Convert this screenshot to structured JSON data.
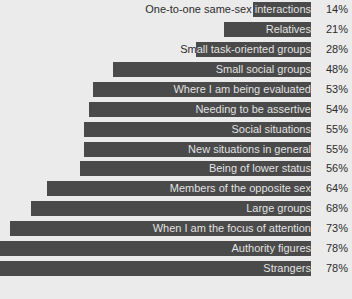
{
  "chart_data": {
    "type": "bar",
    "orientation": "horizontal",
    "title": "",
    "subtitle": "",
    "xlabel": "",
    "ylabel": "",
    "xlim": [
      0,
      78
    ],
    "grid": false,
    "legend": null,
    "value_suffix": "%",
    "bar_color": "#4a4a4a",
    "background_color": "#ebebeb",
    "label_color_on_background": "#2b2b2b",
    "label_color_on_bar": "#e8e8e8",
    "categories": [
      "One-to-one same-sex interactions",
      "Relatives",
      "Small task-oriented groups",
      "Small social groups",
      "Where I am being evaluated",
      "Needing to be assertive",
      "Social situations",
      "New situations in general",
      "Being of lower status",
      "Members of the opposite sex",
      "Large groups",
      "When I am the focus of attention",
      "Authority figures",
      "Strangers"
    ],
    "values": [
      14,
      21,
      28,
      48,
      53,
      54,
      55,
      55,
      56,
      64,
      68,
      73,
      78,
      78
    ],
    "value_labels": [
      "14%",
      "21%",
      "28%",
      "48%",
      "53%",
      "54%",
      "55%",
      "55%",
      "56%",
      "64%",
      "68%",
      "73%",
      "78%",
      "78%"
    ]
  }
}
